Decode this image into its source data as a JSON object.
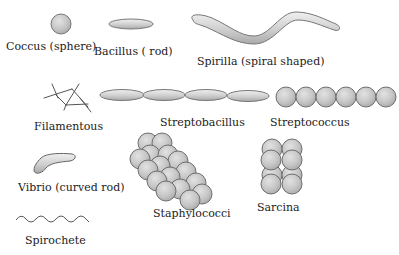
{
  "diagram": {
    "colors": {
      "cell_fill": "#c4c4c4",
      "cell_stroke": "#6e6e6e",
      "line": "#555555",
      "text": "#222222",
      "background": "#ffffff"
    },
    "shapes": [
      {
        "id": "coccus",
        "label": "Coccus (sphere)"
      },
      {
        "id": "bacillus",
        "label": "Bacillus ( rod)"
      },
      {
        "id": "spirilla",
        "label": "Spirilla (spiral shaped)"
      },
      {
        "id": "filamentous",
        "label": "Filamentous"
      },
      {
        "id": "streptobacillus",
        "label": "Streptobacillus"
      },
      {
        "id": "streptococcus",
        "label": "Streptococcus"
      },
      {
        "id": "vibrio",
        "label": "Vibrio (curved rod)"
      },
      {
        "id": "staphylococci",
        "label": "Staphylococci"
      },
      {
        "id": "sarcina",
        "label": "Sarcina"
      },
      {
        "id": "spirochete",
        "label": "Spirochete"
      }
    ]
  }
}
